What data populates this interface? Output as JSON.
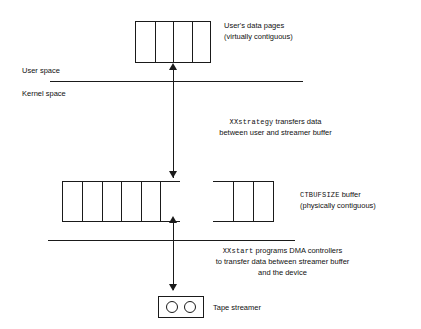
{
  "diagram": {
    "layers": {
      "user_space_label": "User space",
      "kernel_space_label": "Kernel space"
    },
    "user_pages": {
      "label_line1": "User's data pages",
      "label_line2": "(virtually contiguous)",
      "cell_count": 4
    },
    "strategy_note": {
      "line1_code": "XXstrategy",
      "line1_rest": " transfers data",
      "line2": "between user and streamer buffer"
    },
    "buffer": {
      "label_line1_code": "CTBUFSIZE",
      "label_line1_rest": " buffer",
      "label_line2": "(physically contiguous)",
      "left_segment_cells": 6,
      "right_segment_cells": 3
    },
    "start_note": {
      "line1_code": "XXstart",
      "line1_rest": " programs DMA controllers",
      "line2": "to transfer data between streamer buffer",
      "line3": "and the device"
    },
    "device": {
      "label": "Tape streamer",
      "reel_count": 2
    },
    "colors": {
      "stroke": "#1a1a1a",
      "text": "#111111",
      "background": "#ffffff"
    }
  }
}
